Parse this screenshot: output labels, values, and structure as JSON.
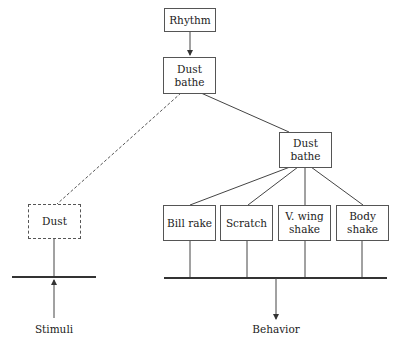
{
  "diagram": {
    "nodes": {
      "rhythm": {
        "label": "Rhythm"
      },
      "dust_bathe_top": {
        "label": "Dust\nbathe"
      },
      "dust_bathe_mid": {
        "label": "Dust\nbathe"
      },
      "dust": {
        "label": "Dust",
        "style": "dashed"
      },
      "bill_rake": {
        "label": "Bill rake"
      },
      "scratch": {
        "label": "Scratch"
      },
      "v_wing_shake": {
        "label": "V. wing\nshake"
      },
      "body_shake": {
        "label": "Body\nshake"
      }
    },
    "io_labels": {
      "stimuli": "Stimuli",
      "behavior": "Behavior"
    },
    "edges": [
      {
        "from": "rhythm",
        "to": "dust_bathe_top",
        "style": "solid-arrow"
      },
      {
        "from": "dust_bathe_top",
        "to": "dust_bathe_mid",
        "style": "solid"
      },
      {
        "from": "dust_bathe_top",
        "to": "dust",
        "style": "dashed"
      },
      {
        "from": "dust_bathe_mid",
        "to": "bill_rake",
        "style": "solid"
      },
      {
        "from": "dust_bathe_mid",
        "to": "scratch",
        "style": "solid"
      },
      {
        "from": "dust_bathe_mid",
        "to": "v_wing_shake",
        "style": "solid"
      },
      {
        "from": "dust_bathe_mid",
        "to": "body_shake",
        "style": "solid"
      },
      {
        "from": "stimuli",
        "to": "dust",
        "style": "solid-arrow"
      },
      {
        "from": "motor_bar",
        "to": "behavior",
        "style": "solid-arrow"
      }
    ]
  }
}
